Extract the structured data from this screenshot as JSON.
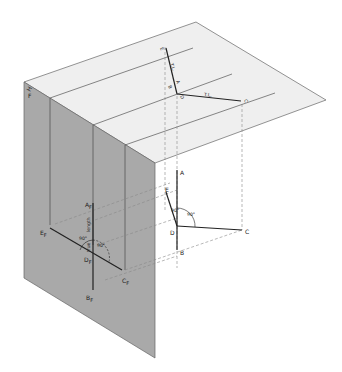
{
  "diagram": {
    "colors": {
      "frontal_plane": "#a9a9a9",
      "horizontal_plane": "#efefef",
      "edge": "#555555",
      "line": "#222222",
      "projector": "#888888"
    },
    "planes": {
      "horizontal": {
        "name": "horizontal-plane"
      },
      "frontal": {
        "name": "frontal-plane"
      }
    },
    "fold_line": {
      "h": "H",
      "f": "F"
    },
    "horizontal_view": {
      "points": {
        "E": {
          "letter": "E",
          "sub": "H"
        },
        "A": {
          "letter": "A",
          "sub": "H"
        },
        "B": {
          "letter": "B",
          "sub": "H"
        },
        "D": {
          "letter": "D",
          "sub": "H"
        },
        "C": {
          "letter": "C",
          "sub": "H"
        }
      },
      "true_length_1": "T.L.",
      "true_length_2": "T.L."
    },
    "object_3d": {
      "points": {
        "A": "A",
        "B": "B",
        "C": "C",
        "D": "D",
        "E": "E"
      },
      "angle_label": "90°",
      "small_angle_label": "90°"
    },
    "frontal_view": {
      "points": {
        "A": {
          "letter": "A",
          "sub": "F"
        },
        "B": {
          "letter": "B",
          "sub": "F"
        },
        "C": {
          "letter": "C",
          "sub": "F"
        },
        "D": {
          "letter": "D",
          "sub": "F"
        },
        "E": {
          "letter": "E",
          "sub": "F"
        }
      },
      "angle_label_1": "90°",
      "angle_label_2": "90°",
      "dim_label_1": "length",
      "dim_label_2": "true"
    }
  }
}
